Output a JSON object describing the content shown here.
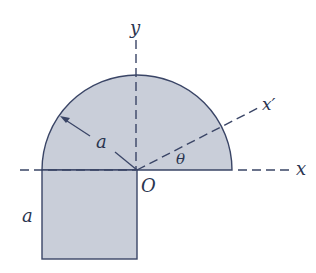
{
  "diagram": {
    "type": "geometry-figure",
    "colors": {
      "fill": "#c9ced9",
      "outline": "#3a4566",
      "axis": "#3a4566",
      "text": "#2a3550",
      "background": "#ffffff"
    },
    "labels": {
      "y_axis": "y",
      "x_axis": "x",
      "x_prime_axis": "x′",
      "origin": "O",
      "radius": "a",
      "square_side": "a",
      "angle": "θ"
    }
  }
}
